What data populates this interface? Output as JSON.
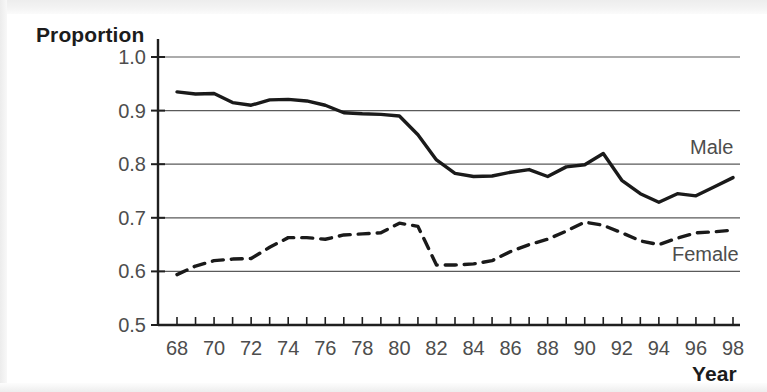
{
  "chart_data": {
    "type": "line",
    "title": "",
    "xlabel": "Year",
    "ylabel": "Proportion",
    "xlim": [
      68,
      98
    ],
    "ylim": [
      0.5,
      1.0
    ],
    "ytick_labels": [
      "1.0",
      "0.9",
      "0.8",
      "0.7",
      "0.6",
      "0.5"
    ],
    "yticks": [
      1.0,
      0.9,
      0.8,
      0.7,
      0.6,
      0.5
    ],
    "xtick_labels": [
      "68",
      "70",
      "72",
      "74",
      "76",
      "78",
      "80",
      "82",
      "84",
      "86",
      "88",
      "90",
      "92",
      "94",
      "96",
      "98"
    ],
    "xticks": [
      68,
      70,
      72,
      74,
      76,
      78,
      80,
      82,
      84,
      86,
      88,
      90,
      92,
      94,
      96,
      98
    ],
    "xticks_minor": [
      69,
      71,
      73,
      75,
      77,
      79,
      81,
      83,
      85,
      87,
      89,
      91,
      93,
      95,
      97
    ],
    "grid": "horizontal",
    "legend_position": "inline-right",
    "x": [
      68,
      69,
      70,
      71,
      72,
      73,
      74,
      75,
      76,
      77,
      78,
      79,
      80,
      81,
      82,
      83,
      84,
      85,
      86,
      87,
      88,
      89,
      90,
      91,
      92,
      93,
      94,
      95,
      96,
      97,
      98
    ],
    "series": [
      {
        "name": "Male",
        "style": "solid",
        "color": "#1a1a1a",
        "values": [
          0.935,
          0.931,
          0.932,
          0.915,
          0.91,
          0.92,
          0.921,
          0.918,
          0.91,
          0.896,
          0.894,
          0.893,
          0.89,
          0.855,
          0.808,
          0.783,
          0.777,
          0.778,
          0.785,
          0.79,
          0.777,
          0.795,
          0.799,
          0.82,
          0.77,
          0.745,
          0.729,
          0.745,
          0.741,
          0.758,
          0.775
        ]
      },
      {
        "name": "Female",
        "style": "dashed",
        "color": "#1a1a1a",
        "values": [
          0.594,
          0.61,
          0.62,
          0.623,
          0.624,
          0.645,
          0.663,
          0.663,
          0.66,
          0.668,
          0.67,
          0.672,
          0.69,
          0.684,
          0.612,
          0.612,
          0.614,
          0.62,
          0.637,
          0.65,
          0.66,
          0.675,
          0.692,
          0.686,
          0.672,
          0.657,
          0.65,
          0.662,
          0.672,
          0.674,
          0.677
        ]
      }
    ]
  },
  "labels": {
    "male": "Male",
    "female": "Female"
  }
}
